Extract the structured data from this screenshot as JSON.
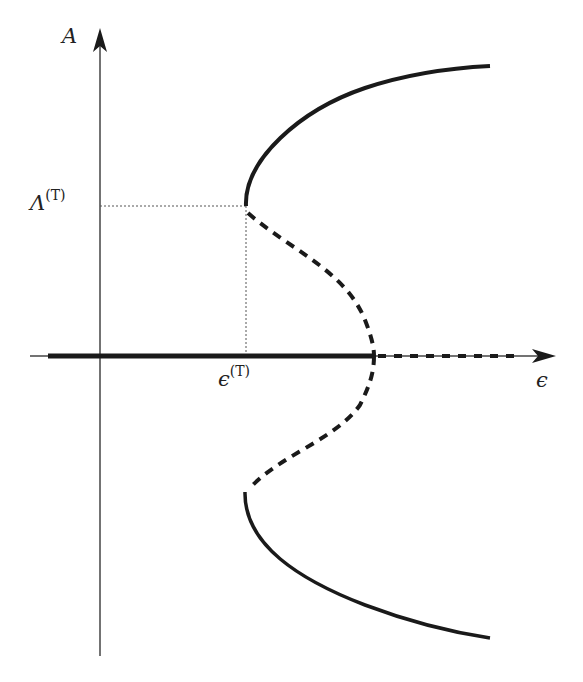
{
  "diagram": {
    "type": "bifurcation-diagram",
    "axes": {
      "y_label": "A",
      "x_label": "ϵ"
    },
    "ticks": {
      "y_tick": {
        "base": "Λ",
        "sup": "(T)"
      },
      "x_tick": {
        "base": "ϵ",
        "sup": "(T)"
      }
    },
    "branches": [
      {
        "name": "trivial-stable",
        "style": "solid",
        "description": "A=0 for ϵ < critical value"
      },
      {
        "name": "trivial-unstable",
        "style": "dashed",
        "description": "A=0 beyond critical value"
      },
      {
        "name": "upper-unstable",
        "style": "dashed",
        "description": "from turning point down to axis"
      },
      {
        "name": "upper-stable",
        "style": "solid",
        "description": "from turning point upward"
      },
      {
        "name": "lower-unstable",
        "style": "dashed"
      },
      {
        "name": "lower-stable",
        "style": "solid"
      }
    ],
    "colors": {
      "ink": "#1a1a1a",
      "axis": "#444444",
      "guide": "#555555"
    }
  }
}
